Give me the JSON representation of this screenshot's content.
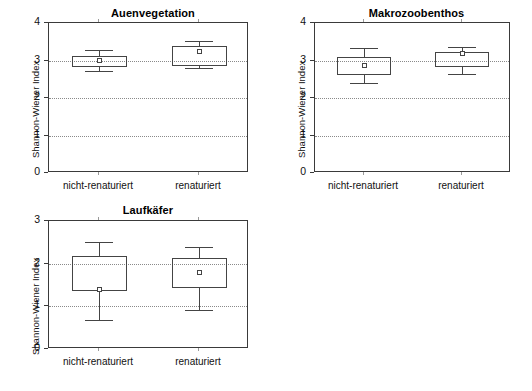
{
  "figure": {
    "width": 532,
    "height": 391,
    "background": "#ffffff",
    "line_color": "#444444",
    "grid_color": "#8a8a8a"
  },
  "chart_data": [
    {
      "type": "box",
      "id": "auenvegetation",
      "title": "Auenvegetation",
      "xlabel": "",
      "ylabel": "Shannon-Wiener Index",
      "ylim": [
        0,
        4
      ],
      "yticks": [
        0,
        1,
        2,
        3,
        4
      ],
      "ytick_labels": [
        "0",
        "1",
        "2",
        "3",
        "4"
      ],
      "gridlines": [
        1,
        2,
        3
      ],
      "grid": true,
      "legend": "none",
      "categories": [
        "nicht-renaturiert",
        "renaturiert"
      ],
      "boxes": [
        {
          "category": "nicht-renaturiert",
          "whisker_low": 2.72,
          "q1": 2.83,
          "median": 2.97,
          "mean": 3.0,
          "q3": 3.12,
          "whisker_high": 3.28
        },
        {
          "category": "renaturiert",
          "whisker_low": 2.8,
          "q1": 2.86,
          "median": 2.9,
          "mean": 3.25,
          "q3": 3.4,
          "whisker_high": 3.52
        }
      ]
    },
    {
      "type": "box",
      "id": "makrozoobenthos",
      "title": "Makrozoobenthos",
      "xlabel": "",
      "ylabel": "Shannon-Wiener Index",
      "ylim": [
        0,
        4
      ],
      "yticks": [
        0,
        1,
        2,
        3,
        4
      ],
      "ytick_labels": [
        "0",
        "1",
        "2",
        "3",
        "4"
      ],
      "gridlines": [
        1,
        2,
        3
      ],
      "grid": true,
      "legend": "none",
      "categories": [
        "nicht-renaturiert",
        "renaturiert"
      ],
      "boxes": [
        {
          "category": "nicht-renaturiert",
          "whisker_low": 2.4,
          "q1": 2.62,
          "median": 2.72,
          "mean": 2.88,
          "q3": 3.1,
          "whisker_high": 3.34
        },
        {
          "category": "renaturiert",
          "whisker_low": 2.65,
          "q1": 2.83,
          "median": 2.9,
          "mean": 3.18,
          "q3": 3.22,
          "whisker_high": 3.35
        }
      ]
    },
    {
      "type": "box",
      "id": "laufkaefer",
      "title": "Laufkäfer",
      "xlabel": "",
      "ylabel": "Shannon-Wiener Index",
      "ylim": [
        0,
        3
      ],
      "yticks": [
        0,
        1,
        2,
        3
      ],
      "ytick_labels": [
        "0",
        "1",
        "2",
        "3"
      ],
      "gridlines": [
        1,
        2
      ],
      "grid": true,
      "legend": "none",
      "categories": [
        "nicht-renaturiert",
        "renaturiert"
      ],
      "boxes": [
        {
          "category": "nicht-renaturiert",
          "whisker_low": 0.68,
          "q1": 1.35,
          "median": 1.37,
          "mean": 1.39,
          "q3": 2.19,
          "whisker_high": 2.51
        },
        {
          "category": "renaturiert",
          "whisker_low": 0.92,
          "q1": 1.43,
          "median": 1.45,
          "mean": 1.79,
          "q3": 2.14,
          "whisker_high": 2.39
        }
      ]
    }
  ]
}
